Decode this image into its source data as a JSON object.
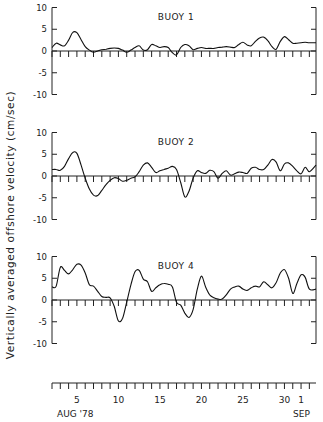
{
  "chart_data": {
    "type": "line",
    "ylabel": "Vertically averaged offshore velocity (cm/sec)",
    "xlabel": "AUG '78 – SEP",
    "x_ticks": [
      5,
      10,
      15,
      20,
      25,
      30,
      1
    ],
    "x_tick_labels": [
      "5",
      "10",
      "15",
      "20",
      "25",
      "30",
      "1"
    ],
    "x_month_labels": [
      "AUG '78",
      "SEP"
    ],
    "x_range_days": [
      2,
      33.8
    ],
    "y_ticks": [
      10,
      5,
      0,
      -5,
      -10
    ],
    "ylim": [
      -10,
      10
    ],
    "grid": false,
    "panels": [
      {
        "name": "BUOY 1",
        "x": [
          2,
          2.5,
          3,
          3.5,
          4,
          4.5,
          5,
          5.5,
          6,
          6.5,
          7,
          7.5,
          8,
          8.5,
          9,
          9.5,
          10,
          10.5,
          11,
          11.5,
          12,
          12.5,
          13,
          13.5,
          14,
          14.5,
          15,
          15.5,
          16,
          16.5,
          17,
          17.5,
          18,
          18.5,
          19,
          19.5,
          20,
          20.5,
          21,
          21.5,
          22,
          22.5,
          23,
          23.5,
          24,
          24.5,
          25,
          25.5,
          26,
          26.5,
          27,
          27.5,
          28,
          28.5,
          29,
          29.5,
          30,
          30.5,
          31,
          31.5,
          32,
          32.5,
          33,
          33.8
        ],
        "values": [
          0.8,
          1.8,
          1.4,
          1.2,
          2.5,
          4.3,
          4.2,
          2.6,
          1.0,
          0.2,
          -0.3,
          0,
          0.3,
          0.4,
          0.6,
          0.7,
          0.6,
          0.2,
          -0.3,
          0.2,
          0.8,
          1.2,
          0.2,
          0.3,
          1.5,
          1.2,
          0.8,
          1.0,
          0.8,
          -0.4,
          -0.9,
          0.8,
          1.5,
          1.2,
          0.3,
          0.6,
          0.8,
          0.6,
          0.6,
          0.6,
          0.8,
          0.9,
          1.0,
          0.9,
          0.8,
          1.5,
          2.0,
          1.4,
          1.2,
          2.2,
          3.0,
          3.2,
          2.4,
          1.0,
          0.4,
          2.2,
          3.3,
          2.6,
          1.8,
          1.8,
          1.9,
          2.0,
          1.9,
          1.9
        ]
      },
      {
        "name": "BUOY 2",
        "x": [
          2,
          2.5,
          3,
          3.5,
          4,
          4.5,
          5,
          5.5,
          6,
          6.5,
          7,
          7.5,
          8,
          8.5,
          9,
          9.5,
          10,
          10.5,
          11,
          11.5,
          12,
          12.5,
          13,
          13.5,
          14,
          14.5,
          15,
          15.5,
          16,
          16.5,
          17,
          17.5,
          18,
          18.5,
          19,
          19.5,
          20,
          20.5,
          21,
          21.5,
          22,
          22.5,
          23,
          23.5,
          24,
          24.5,
          25,
          25.5,
          26,
          26.5,
          27,
          27.5,
          28,
          28.5,
          29,
          29.5,
          30,
          30.5,
          31,
          31.5,
          32,
          32.5,
          33,
          33.8
        ],
        "values": [
          1.5,
          1.5,
          1.3,
          2.2,
          4.0,
          5.4,
          5.2,
          2.5,
          -0.5,
          -3.0,
          -4.4,
          -4.5,
          -3.3,
          -2.0,
          -1.0,
          -0.4,
          -0.6,
          -1.2,
          -1.0,
          -0.5,
          -0.2,
          1.0,
          2.5,
          3.0,
          2.0,
          0.8,
          1.2,
          1.5,
          1.8,
          2.2,
          1.5,
          -1.5,
          -4.8,
          -3.5,
          -0.5,
          1.2,
          0.8,
          0.6,
          1.3,
          1.0,
          -0.5,
          0.6,
          1.2,
          0.2,
          0.5,
          0.9,
          0.8,
          0.6,
          1.8,
          2.0,
          1.5,
          1.5,
          2.5,
          3.8,
          3.2,
          1.2,
          2.8,
          3.0,
          2.2,
          1.2,
          0.5,
          2.0,
          1.0,
          2.5
        ]
      },
      {
        "name": "BUOY 4",
        "x": [
          2,
          2.5,
          3,
          3.5,
          4,
          4.5,
          5,
          5.5,
          6,
          6.5,
          7,
          7.5,
          8,
          8.5,
          9,
          9.5,
          10,
          10.5,
          11,
          11.5,
          12,
          12.5,
          13,
          13.5,
          14,
          14.5,
          15,
          15.5,
          16,
          16.5,
          17,
          17.5,
          18,
          18.5,
          19,
          19.5,
          20,
          20.5,
          21,
          21.5,
          22,
          22.5,
          23,
          23.5,
          24,
          24.5,
          25,
          25.5,
          26,
          26.5,
          27,
          27.5,
          28,
          28.5,
          29,
          29.5,
          30,
          30.5,
          31,
          31.5,
          32,
          32.5,
          33,
          33.8
        ],
        "values": [
          3.0,
          3.2,
          7.5,
          6.8,
          6.0,
          7.0,
          8.2,
          8.0,
          6.2,
          3.5,
          3.2,
          2.0,
          0.8,
          0.6,
          0.5,
          -1.5,
          -4.8,
          -4.2,
          -0.5,
          3.5,
          6.5,
          6.8,
          4.8,
          4.2,
          2.0,
          2.8,
          3.5,
          3.8,
          3.6,
          3.0,
          -0.5,
          -1.2,
          -3.0,
          -4.0,
          -2.2,
          2.5,
          5.5,
          3.0,
          1.2,
          0.5,
          0.2,
          0.2,
          1.2,
          2.5,
          3.0,
          3.2,
          2.5,
          2.2,
          2.8,
          3.2,
          3.0,
          4.2,
          3.5,
          2.8,
          4.0,
          6.2,
          7.0,
          5.0,
          1.5,
          3.8,
          5.8,
          5.2,
          2.5,
          2.5
        ]
      }
    ]
  },
  "labels": {
    "ylabel": "Vertically averaged offshore velocity (cm/sec)",
    "aug": "AUG '78",
    "sep": "SEP"
  }
}
